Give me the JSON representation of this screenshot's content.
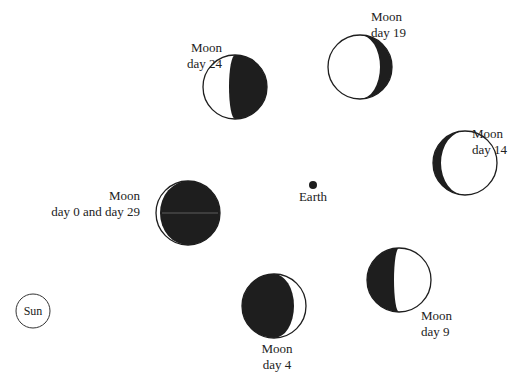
{
  "colors": {
    "ink": "#1e1e1e",
    "paper": "#ffffff"
  },
  "earth": {
    "label": "Earth"
  },
  "sun": {
    "label": "Sun"
  },
  "moons": [
    {
      "id": "day24",
      "line1": "Moon",
      "line2": "day 24",
      "phase": "waning crescent / third quarter, right side dark"
    },
    {
      "id": "day19",
      "line1": "Moon",
      "line2": "day 19",
      "phase": "waning gibbous, thin dark crescent on right"
    },
    {
      "id": "day14",
      "line1": "Moon",
      "line2": "day 14",
      "phase": "nearly full, thin dark crescent on left"
    },
    {
      "id": "day0",
      "line1": "Moon",
      "line2": "day 0 and day 29",
      "phase": "new moon, thin lit sliver on left"
    },
    {
      "id": "day9",
      "line1": "Moon",
      "line2": "day 9",
      "phase": "half lit, left side dark"
    },
    {
      "id": "day4",
      "line1": "Moon",
      "line2": "day 4",
      "phase": "crescent, thin lit sliver on right"
    }
  ]
}
